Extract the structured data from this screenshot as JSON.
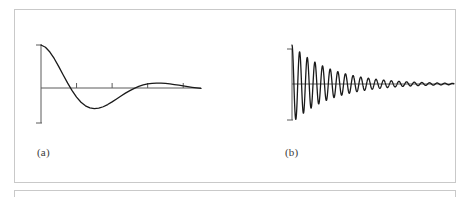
{
  "figure": {
    "border_color": "#c9c9c9",
    "background": "#ffffff",
    "curve_color": "#1a1a1a",
    "axis_color": "#5a5a5a",
    "panels": [
      {
        "id": "a",
        "label": "(a)"
      },
      {
        "id": "b",
        "label": "(b)"
      }
    ]
  },
  "chart_data": [
    {
      "type": "line",
      "title": "",
      "subtitle": "",
      "xlabel": "",
      "ylabel": "",
      "label": "(a)",
      "description": "Underdamped step/impulse response: a slowly decaying oscillation starting at a positive peak, crossing zero, reaching a negative trough, then a small positive hump before settling toward zero.",
      "grid": false,
      "legend": null,
      "xlim": [
        0,
        9
      ],
      "ylim": [
        -1.1,
        1.1
      ],
      "xticks": [
        2,
        4,
        6,
        8
      ],
      "yticks": [
        -1,
        0,
        1
      ],
      "xticklabels": [
        "",
        "",
        "",
        ""
      ],
      "yticklabels": [
        "",
        "",
        ""
      ],
      "series": [
        {
          "name": "damped-oscillation-slow",
          "amplitude": 1.0,
          "decay": 0.42,
          "frequency_rad": 1.18,
          "phase_rad": 1.5708,
          "x": [
            0.0,
            0.25,
            0.5,
            0.75,
            1.0,
            1.25,
            1.5,
            1.75,
            2.0,
            2.25,
            2.5,
            2.75,
            3.0,
            3.25,
            3.5,
            3.75,
            4.0,
            4.25,
            4.5,
            4.75,
            5.0,
            5.25,
            5.5,
            5.75,
            6.0,
            6.25,
            6.5,
            6.75,
            7.0,
            7.25,
            7.5,
            7.75,
            8.0,
            8.25,
            8.5,
            8.75,
            9.0
          ],
          "y": [
            1.0,
            0.947,
            0.836,
            0.681,
            0.498,
            0.303,
            0.112,
            -0.062,
            -0.212,
            -0.331,
            -0.415,
            -0.464,
            -0.481,
            -0.47,
            -0.436,
            -0.385,
            -0.323,
            -0.255,
            -0.186,
            -0.12,
            -0.06,
            -0.007,
            0.036,
            0.07,
            0.094,
            0.108,
            0.114,
            0.113,
            0.106,
            0.095,
            0.081,
            0.065,
            0.048,
            0.032,
            0.016,
            0.002,
            -0.01
          ]
        }
      ]
    },
    {
      "type": "line",
      "title": "",
      "subtitle": "",
      "xlabel": "",
      "ylabel": "",
      "label": "(b)",
      "description": "Lightly damped high-frequency oscillation: roughly 21 visible cycles whose envelope decays exponentially from a large initial amplitude to near zero at the right edge.",
      "grid": false,
      "legend": null,
      "xlim": [
        0,
        9
      ],
      "ylim": [
        -1.15,
        1.15
      ],
      "xticks": [],
      "yticks": [
        -1,
        0,
        1
      ],
      "xticklabels": [],
      "yticklabels": [
        "",
        "",
        ""
      ],
      "cycles_visible": 21,
      "series": [
        {
          "name": "damped-oscillation-fast",
          "amplitude": 1.08,
          "decay": 0.45,
          "frequency_rad": 14.8,
          "phase_rad": 0.0,
          "envelope_start": 1.08,
          "envelope_end": 0.06
        }
      ]
    }
  ]
}
